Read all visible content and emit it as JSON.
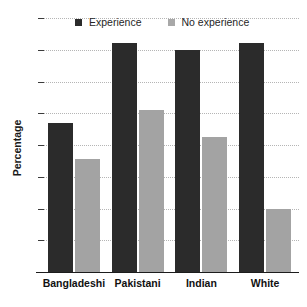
{
  "chart_data": {
    "type": "bar",
    "title": "",
    "title_fragment_visible": "partially cropped heading above plot",
    "xlabel": "",
    "ylabel": "Percentage",
    "ylim": [
      0,
      80
    ],
    "ytick_step": 10,
    "yticks": [
      "0",
      "10",
      "20",
      "30",
      "40",
      "50",
      "60",
      "70",
      "80"
    ],
    "grid": true,
    "grid_style": "dotted-horizontal",
    "legend_position": "top-inside",
    "categories": [
      "Bangladeshi",
      "Pakistani",
      "Indian",
      "White"
    ],
    "series": [
      {
        "name": "Experience",
        "color": "#2b2b2b",
        "values": [
          47,
          72,
          70,
          72
        ]
      },
      {
        "name": "No experience",
        "color": "#a3a3a3",
        "values": [
          35.5,
          51,
          42.5,
          20
        ]
      }
    ]
  },
  "colors": {
    "experience": "#2b2b2b",
    "no_experience": "#a3a3a3",
    "grid": "#b5b5b5",
    "axis": "#1c1c1c",
    "background": "#ffffff"
  }
}
